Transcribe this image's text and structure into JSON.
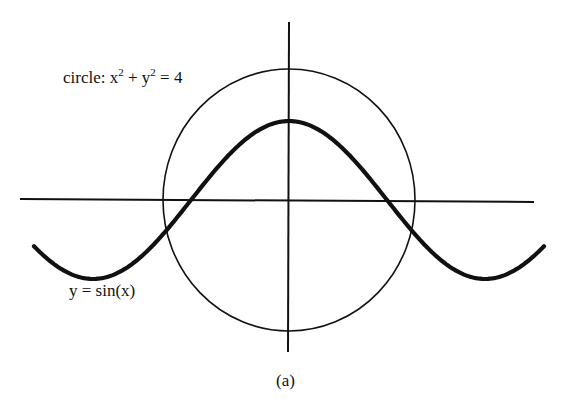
{
  "diagram": {
    "caption": "(a)",
    "circle_label": {
      "prefix": "circle: x",
      "exp1": "2",
      "mid": " + y",
      "exp2": "2",
      "suffix": " = 4"
    },
    "sine_label": "y = sin(x)",
    "elements": [
      {
        "type": "axis",
        "name": "x-axis"
      },
      {
        "type": "axis",
        "name": "y-axis"
      },
      {
        "type": "curve",
        "name": "circle",
        "equation": "x^2 + y^2 = 4"
      },
      {
        "type": "curve",
        "name": "sine",
        "equation": "y = sin(x)"
      }
    ],
    "colors": {
      "stroke": "#111111",
      "background": "#ffffff"
    }
  }
}
